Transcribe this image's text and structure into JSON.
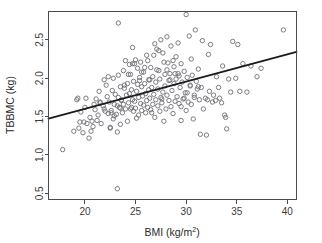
{
  "chart_data": {
    "type": "scatter",
    "title": "",
    "xlabel": "BMI (kg/m2)",
    "xlabel_base": "BMI (kg/m",
    "xlabel_sup": "2",
    "xlabel_tail": ")",
    "ylabel": "TBBMC (kg)",
    "xlim": [
      16.4,
      40.9
    ],
    "ylim": [
      0.42,
      2.87
    ],
    "xticks": [
      20,
      25,
      30,
      35,
      40
    ],
    "xticklabels": [
      "20",
      "25",
      "30",
      "35",
      "40"
    ],
    "yticks": [
      0.5,
      1.0,
      1.5,
      2.0,
      2.5
    ],
    "yticklabels": [
      "0.5",
      "1.0",
      "1.5",
      "2.0",
      "2.5"
    ],
    "grid": false,
    "legend": null,
    "marker": "open-circle",
    "marker_color": "#6e6e75",
    "line_color": "#1c1c1c",
    "fit_line": {
      "name": "least-squares regression line",
      "x": [
        16.4,
        40.9
      ],
      "y": [
        1.475,
        2.345
      ],
      "slope": 0.0355,
      "intercept": 0.893
    },
    "x": [
      17.8,
      18.9,
      19.2,
      19.3,
      19.4,
      19.5,
      19.6,
      19.8,
      20.0,
      20.1,
      20.2,
      20.4,
      20.5,
      20.6,
      20.8,
      20.9,
      21.0,
      21.1,
      21.2,
      21.3,
      21.4,
      21.5,
      21.6,
      21.8,
      21.9,
      22.0,
      22.1,
      22.2,
      22.3,
      22.4,
      22.5,
      22.5,
      22.6,
      22.7,
      22.8,
      22.8,
      22.9,
      23.0,
      23.1,
      23.2,
      23.2,
      23.3,
      23.3,
      23.4,
      23.5,
      23.5,
      23.6,
      23.7,
      23.8,
      23.8,
      23.9,
      24.0,
      24.0,
      24.1,
      24.2,
      24.2,
      24.3,
      24.4,
      24.4,
      24.5,
      24.5,
      24.6,
      24.7,
      24.7,
      24.8,
      24.8,
      24.9,
      25.0,
      25.0,
      25.1,
      25.1,
      25.2,
      25.2,
      25.3,
      25.3,
      25.4,
      25.5,
      25.5,
      25.6,
      25.6,
      25.7,
      25.8,
      25.8,
      25.9,
      26.0,
      26.0,
      26.1,
      26.1,
      26.2,
      26.3,
      26.3,
      26.4,
      26.5,
      26.5,
      26.6,
      26.7,
      26.7,
      26.8,
      26.9,
      26.9,
      27.0,
      27.0,
      27.1,
      27.2,
      27.2,
      27.3,
      27.4,
      27.4,
      27.5,
      27.5,
      27.6,
      27.7,
      27.7,
      27.8,
      27.9,
      27.9,
      28.0,
      28.1,
      28.1,
      28.2,
      28.3,
      28.3,
      28.4,
      28.5,
      28.5,
      28.6,
      28.7,
      28.8,
      28.8,
      28.9,
      29.0,
      29.0,
      29.1,
      29.2,
      29.3,
      29.3,
      29.4,
      29.5,
      29.5,
      29.6,
      29.7,
      29.8,
      29.9,
      30.0,
      30.0,
      30.1,
      30.2,
      30.3,
      30.4,
      30.5,
      30.5,
      30.6,
      30.7,
      30.8,
      30.9,
      31.0,
      31.1,
      31.2,
      31.3,
      31.4,
      31.5,
      31.6,
      31.7,
      31.9,
      32.0,
      32.2,
      32.3,
      32.4,
      32.6,
      32.7,
      32.9,
      33.0,
      33.2,
      33.3,
      33.5,
      33.6,
      33.8,
      34.0,
      34.2,
      34.4,
      34.6,
      34.9,
      35.1,
      35.3,
      35.6,
      36.0,
      36.4,
      37.0,
      37.4,
      39.6,
      23.2,
      23.3,
      24.7,
      26.2,
      27.1,
      28.1,
      29.5,
      30.4,
      21.9,
      22.6,
      23.9,
      24.9,
      25.6,
      26.4,
      27.3,
      28.4,
      29.2,
      30.1,
      31.2,
      22.3,
      23.6,
      24.3,
      25.4,
      26.8,
      27.8,
      28.7,
      29.8,
      20.7,
      21.5,
      22.9,
      24.6,
      25.9,
      26.6,
      27.6,
      28.9,
      30.8,
      32.1,
      33.9,
      19.9,
      23.5
    ],
    "y": [
      1.07,
      1.31,
      1.72,
      1.74,
      1.35,
      1.43,
      1.56,
      1.29,
      1.62,
      1.74,
      1.41,
      1.22,
      1.49,
      1.31,
      1.37,
      1.66,
      1.59,
      1.73,
      1.45,
      1.52,
      1.83,
      1.68,
      1.41,
      1.64,
      1.98,
      1.57,
      1.91,
      1.76,
      2.02,
      1.69,
      1.35,
      1.36,
      1.58,
      1.84,
      1.47,
      2.0,
      1.66,
      1.79,
      1.53,
      1.3,
      0.56,
      1.75,
      2.72,
      1.62,
      1.89,
      1.4,
      1.71,
      1.55,
      2.1,
      1.66,
      1.87,
      1.6,
      2.23,
      1.78,
      1.44,
      1.93,
      1.68,
      2.18,
      1.8,
      1.6,
      2.05,
      1.85,
      1.72,
      2.4,
      1.57,
      1.96,
      1.7,
      1.61,
      2.24,
      1.83,
      1.48,
      1.92,
      2.13,
      1.75,
      1.52,
      2.01,
      1.67,
      2.21,
      1.58,
      1.89,
      1.77,
      1.65,
      2.08,
      1.93,
      1.55,
      1.8,
      1.71,
      2.3,
      1.62,
      1.98,
      1.85,
      1.74,
      1.59,
      2.14,
      1.88,
      1.66,
      2.02,
      1.79,
      1.49,
      2.45,
      1.72,
      1.95,
      2.38,
      1.64,
      1.86,
      2.1,
      1.57,
      1.99,
      1.75,
      2.5,
      1.68,
      2.33,
      1.82,
      1.44,
      2.05,
      1.9,
      1.6,
      2.54,
      1.78,
      2.2,
      1.71,
      1.97,
      2.06,
      1.63,
      2.42,
      1.84,
      1.54,
      2.15,
      1.93,
      1.7,
      1.99,
      2.28,
      1.76,
      2.46,
      1.67,
      2.03,
      1.88,
      1.45,
      2.19,
      1.95,
      1.73,
      2.09,
      1.81,
      1.58,
      2.83,
      2.01,
      1.69,
      2.55,
      1.9,
      2.25,
      1.66,
      2.04,
      1.47,
      1.78,
      2.63,
      1.96,
      1.86,
      2.12,
      1.72,
      1.27,
      1.88,
      2.49,
      1.6,
      1.74,
      1.26,
      2.31,
      1.83,
      2.44,
      1.69,
      1.78,
      1.71,
      2.02,
      1.88,
      1.74,
      1.68,
      2.16,
      1.52,
      1.34,
      1.99,
      1.82,
      2.48,
      2.0,
      2.44,
      1.83,
      2.19,
      1.82,
      2.16,
      2.02,
      2.13,
      2.63,
      1.64,
      2.04,
      2.19,
      2.23,
      2.11,
      2.11,
      1.63,
      1.91,
      1.6,
      1.55,
      1.91,
      2.19,
      2.08,
      1.98,
      2.36,
      1.98,
      2.06,
      1.81,
      1.89,
      1.54,
      1.72,
      2.05,
      1.97,
      2.3,
      2.21,
      2.23,
      1.74,
      1.44,
      1.69,
      1.51,
      1.62,
      2.14,
      1.55,
      1.73,
      2.06,
      1.75,
      1.72,
      1.49,
      1.43,
      1.61
    ]
  }
}
